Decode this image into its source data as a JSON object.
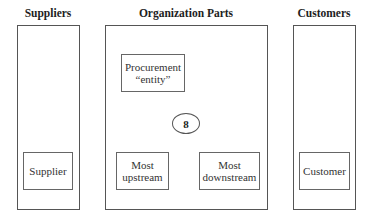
{
  "diagram": {
    "columns": {
      "suppliers": {
        "title": "Suppliers",
        "nodes": [
          {
            "label": "Supplier"
          }
        ]
      },
      "organization": {
        "title": "Organization Parts",
        "nodes": [
          {
            "line1": "Procurement",
            "line2": "“entity”"
          },
          {
            "line1": "Most",
            "line2": "upstream"
          },
          {
            "line1": "Most",
            "line2": "downstream"
          }
        ],
        "marker": "8"
      },
      "customers": {
        "title": "Customers",
        "nodes": [
          {
            "label": "Customer"
          }
        ]
      }
    }
  }
}
